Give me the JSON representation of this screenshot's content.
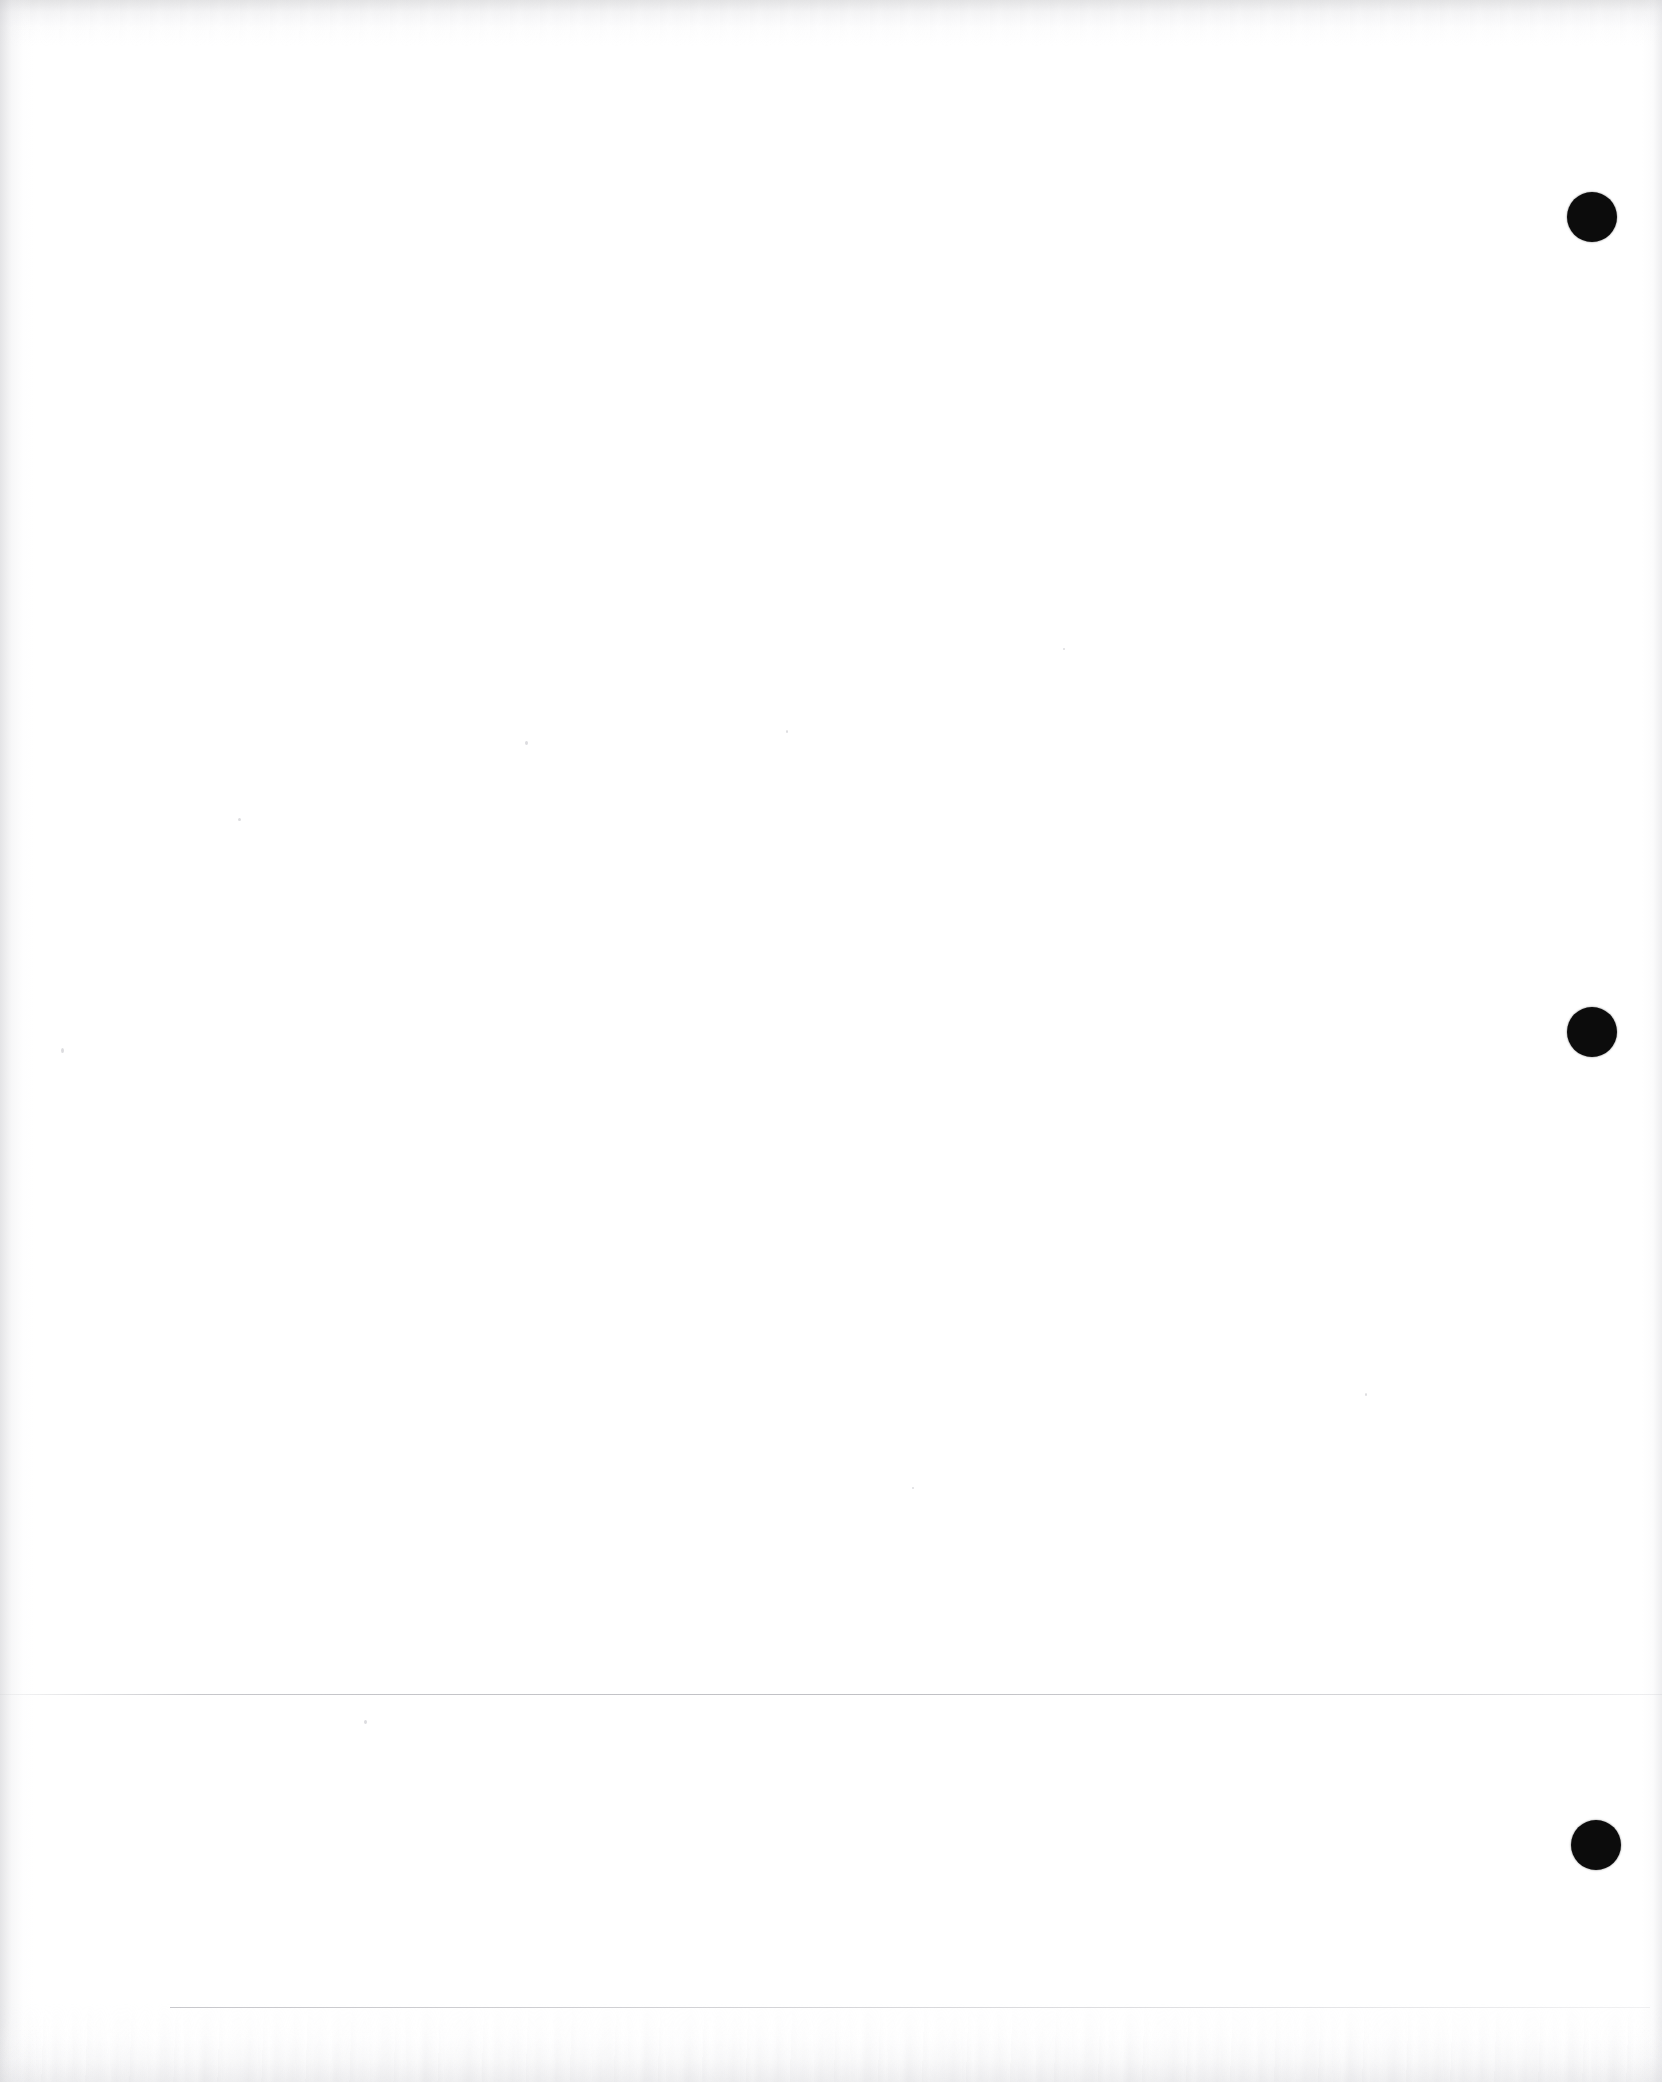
{
  "document": {
    "page_kind": "blank-scanned-page",
    "page_label": "",
    "body_text": "",
    "background_color": "#ffffff",
    "ink_color": "#0c0c0c",
    "rule_color": "#96969c",
    "width_px": 1662,
    "height_px": 2082
  },
  "marks": {
    "registration_dots": [
      {
        "name": "registration-dot-top",
        "cx": 1592,
        "cy": 217,
        "r": 25
      },
      {
        "name": "registration-dot-middle",
        "cx": 1592,
        "cy": 1032,
        "r": 25
      },
      {
        "name": "registration-dot-bottom",
        "cx": 1596,
        "cy": 1845,
        "r": 25
      }
    ],
    "rules": [
      {
        "name": "horizontal-rule-upper",
        "x": 0,
        "y": 1694,
        "width": 1662
      },
      {
        "name": "horizontal-rule-lower",
        "x": 170,
        "y": 2007,
        "width": 1480
      }
    ]
  },
  "artifacts": {
    "top_edge_shading": true,
    "left_edge_shading": true,
    "right_edge_shading": true,
    "bottom_edge_shading": true
  }
}
